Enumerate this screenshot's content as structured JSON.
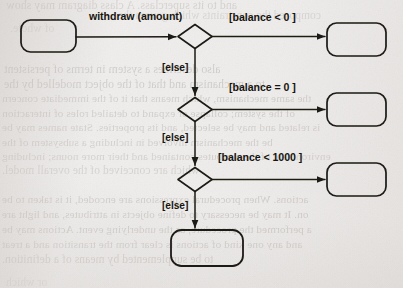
{
  "page": {
    "kind": "scanned-book-page",
    "width": 403,
    "height": 288,
    "paper_color": "#efedec",
    "ink_color": "#17150f",
    "ghost_text_color": "#8e8880"
  },
  "diagram": {
    "type": "uml-state-diagram",
    "title": "",
    "states": [
      {
        "id": "start-state",
        "label": "",
        "x": 21,
        "y": 20,
        "w": 55,
        "h": 32
      },
      {
        "id": "state-neg",
        "label": "",
        "x": 327,
        "y": 23,
        "w": 59,
        "h": 33
      },
      {
        "id": "state-zero",
        "label": "",
        "x": 327,
        "y": 93,
        "w": 59,
        "h": 33
      },
      {
        "id": "state-small",
        "label": "",
        "x": 327,
        "y": 163,
        "w": 59,
        "h": 33
      },
      {
        "id": "state-final",
        "label": "",
        "x": 171,
        "y": 230,
        "w": 72,
        "h": 36
      }
    ],
    "decisions": [
      {
        "id": "decision-1",
        "cx": 195,
        "cy": 36.5,
        "rx": 17,
        "ry": 12
      },
      {
        "id": "decision-2",
        "cx": 195,
        "cy": 109.5,
        "rx": 17,
        "ry": 12
      },
      {
        "id": "decision-3",
        "cx": 195,
        "cy": 179.5,
        "rx": 17,
        "ry": 12
      }
    ],
    "labels": {
      "trigger": "withdraw (amount)",
      "guard_1": "[balance < 0 ]",
      "guard_2": "[balance = 0 ]",
      "guard_3": "[balance < 1000 ]",
      "else_1": "[else]",
      "else_2": "[else]",
      "else_3": "[else]"
    },
    "label_positions": {
      "trigger": {
        "x": 89,
        "y": 11
      },
      "guard_1": {
        "x": 229,
        "y": 12
      },
      "guard_2": {
        "x": 229,
        "y": 82
      },
      "guard_3": {
        "x": 218,
        "y": 152
      },
      "else_1": {
        "x": 162,
        "y": 63
      },
      "else_2": {
        "x": 162,
        "y": 133
      },
      "else_3": {
        "x": 162,
        "y": 201
      }
    }
  },
  "ghost_text": {
    "lines": [
      {
        "text": "and to its superclass. A class diagram may show",
        "x": 6,
        "y": -2,
        "size": 11.8,
        "op": 0.3
      },
      {
        "text": "composed the constraints which govern the",
        "x": 118,
        "y": 9,
        "size": 11.5,
        "op": 0.26
      },
      {
        "text": "of whole.",
        "x": 10,
        "y": 22,
        "size": 11.5,
        "op": 0.22
      },
      {
        "text": "also describes a system in terms of persistent",
        "x": 4,
        "y": 62,
        "size": 11.8,
        "op": 0.36
      },
      {
        "text": "to a mechanism and that of the object modelled by the",
        "x": 4,
        "y": 77,
        "size": 11.8,
        "op": 0.36
      },
      {
        "text": "the same mechanism, which means that it of the immediate concern",
        "x": 2,
        "y": 92,
        "size": 11.2,
        "op": 0.34
      },
      {
        "text": "of the system; collapse or expand to detailed roles of interaction",
        "x": 2,
        "y": 107,
        "size": 11.2,
        "op": 0.34
      },
      {
        "text": "is related and may be selected, and its properties. State names may be",
        "x": 2,
        "y": 121,
        "size": 11.2,
        "op": 0.33
      },
      {
        "text": "be the mechanism involved in including a subsystem of the",
        "x": 2,
        "y": 136,
        "size": 11.2,
        "op": 0.33
      },
      {
        "text": "environment of the attributes contained and their more nouns; including",
        "x": 2,
        "y": 150,
        "size": 11.2,
        "op": 0.32
      },
      {
        "text": "which are conceived of the overall model.",
        "x": 2,
        "y": 164,
        "size": 11.5,
        "op": 0.3
      },
      {
        "text": "actions. When procedural expressions are encoded, it is taken to be",
        "x": 2,
        "y": 193,
        "size": 11.2,
        "op": 0.36
      },
      {
        "text": "on. It may be necessary to define objects in attributes, and light are",
        "x": 2,
        "y": 208,
        "size": 11.2,
        "op": 0.36
      },
      {
        "text": "a performed the procedure, as the underlying event. Actions may be",
        "x": 2,
        "y": 223,
        "size": 11.2,
        "op": 0.36
      },
      {
        "text": "and any one kind of actions is clear from the transition and a treat",
        "x": 2,
        "y": 238,
        "size": 11.2,
        "op": 0.35
      },
      {
        "text": "to be supplemented by means of a definition.",
        "x": 2,
        "y": 253,
        "size": 11.5,
        "op": 0.33
      },
      {
        "text": "or which",
        "x": 6,
        "y": 276,
        "size": 11.5,
        "op": 0.2
      }
    ]
  }
}
